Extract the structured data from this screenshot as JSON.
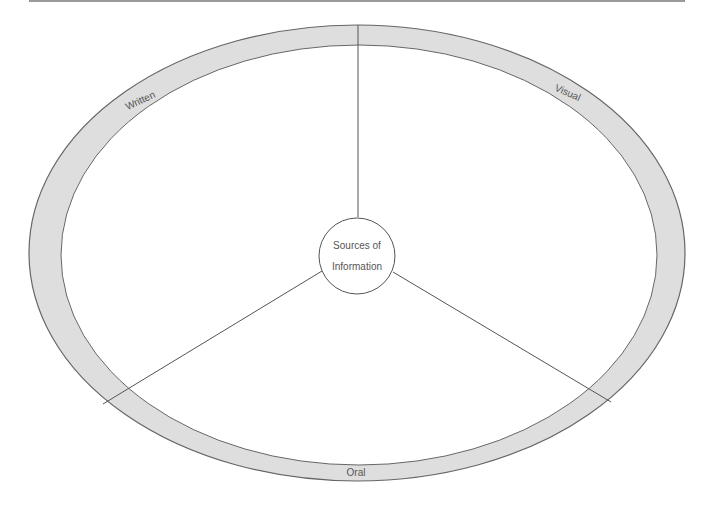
{
  "diagram": {
    "type": "concept-wheel",
    "hub": {
      "line1": "Sources of",
      "line2": "Information"
    },
    "segments": [
      {
        "id": "written",
        "label": "Written"
      },
      {
        "id": "visual",
        "label": "Visual"
      },
      {
        "id": "oral",
        "label": "Oral"
      }
    ],
    "colors": {
      "band_fill": "#dedede",
      "stroke": "#555555",
      "text": "#555555",
      "background": "#ffffff"
    }
  }
}
